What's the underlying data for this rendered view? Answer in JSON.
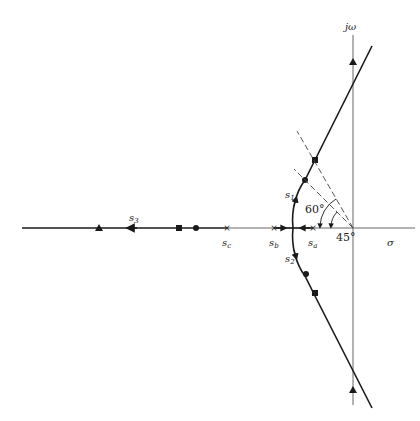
{
  "diagram": {
    "type": "root-locus",
    "axes": {
      "imag_label": "jω",
      "real_label": "σ"
    },
    "poles": [
      {
        "name": "s_a",
        "label_main": "s",
        "label_sub": "a"
      },
      {
        "name": "s_b",
        "label_main": "s",
        "label_sub": "b"
      },
      {
        "name": "s_c",
        "label_main": "s",
        "label_sub": "c"
      }
    ],
    "branches": [
      {
        "label_main": "s",
        "label_sub": "1"
      },
      {
        "label_main": "s",
        "label_sub": "2"
      },
      {
        "label_main": "s",
        "label_sub": "3"
      }
    ],
    "angles": [
      {
        "value": "60°"
      },
      {
        "value": "45°"
      }
    ],
    "colors": {
      "line": "#1a1a1a",
      "axis": "#555555",
      "dash": "#444444"
    }
  }
}
